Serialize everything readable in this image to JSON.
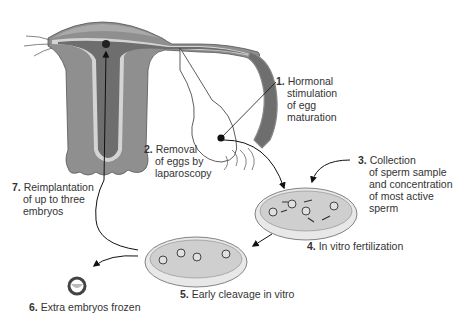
{
  "diagram": {
    "colors": {
      "uterus_wall": "#8f8f8f",
      "uterus_lining": "#d4d4d4",
      "uterus_cavity": "#6e6e6e",
      "dish_fill": "#cfcfcf",
      "dish_rim": "#e8e8e8",
      "line": "#111111"
    },
    "steps": [
      {
        "number": "1.",
        "lines": [
          "Hormonal",
          "stimulation",
          "of egg",
          "maturation"
        ]
      },
      {
        "number": "2.",
        "lines": [
          "Removal",
          "of eggs by",
          "laparoscopy"
        ]
      },
      {
        "number": "3.",
        "lines": [
          "Collection",
          "of sperm sample",
          "and concentration",
          "of most active",
          "sperm"
        ]
      },
      {
        "number": "4.",
        "lines": [
          "In vitro fertilization"
        ]
      },
      {
        "number": "5.",
        "lines": [
          "Early cleavage in vitro"
        ]
      },
      {
        "number": "6.",
        "lines": [
          "Extra embryos frozen"
        ]
      },
      {
        "number": "7.",
        "lines": [
          "Reimplantation",
          "of up to three",
          "embryos"
        ]
      }
    ]
  }
}
